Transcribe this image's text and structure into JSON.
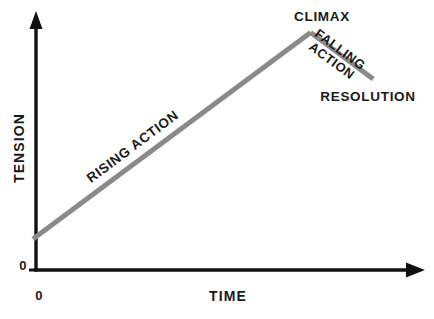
{
  "diagram": {
    "kind": "plot-diagram",
    "background_color": "#ffffff",
    "axis_color": "#111111",
    "curve_color": "#8a8a8a",
    "text_color": "#1a1a1a"
  },
  "axes": {
    "y_title": "TENSION",
    "x_title": "TIME",
    "y_origin_tick_label": "0",
    "x_origin_tick_label": "0"
  },
  "labels": {
    "climax": "CLIMAX",
    "rising_action": "RISING ACTION",
    "falling_line1": "FALLING",
    "falling_line2": "ACTION",
    "resolution": "RESOLUTION"
  },
  "chart_data": {
    "type": "line",
    "title": "",
    "xlabel": "TIME",
    "ylabel": "TENSION",
    "grid": false,
    "legend": "none",
    "xlim": [
      0,
      100
    ],
    "ylim": [
      0,
      100
    ],
    "series": [
      {
        "name": "Narrative tension",
        "color": "#8a8a8a",
        "linewidth": 5,
        "points": [
          {
            "x": 0,
            "label": "exposition",
            "y": 12
          },
          {
            "x": 71,
            "label": "climax",
            "y": 92
          },
          {
            "x": 87,
            "label": "resolution",
            "y": 74
          }
        ]
      }
    ],
    "annotations": [
      {
        "text": "RISING ACTION",
        "x": 25,
        "y": 52,
        "rotation": -36.8
      },
      {
        "text": "CLIMAX",
        "x": 74,
        "y": 98,
        "rotation": 0
      },
      {
        "text": "FALLING ACTION",
        "x": 77,
        "y": 85,
        "rotation": 36.5
      },
      {
        "text": "RESOLUTION",
        "x": 86,
        "y": 68,
        "rotation": 0
      }
    ]
  }
}
